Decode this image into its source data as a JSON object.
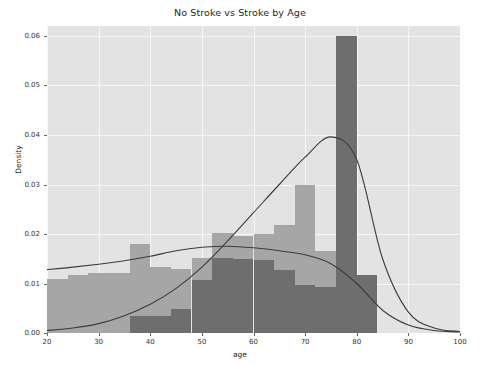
{
  "chart_data": {
    "type": "bar",
    "title": "No Stroke vs Stroke by Age",
    "xlabel": "age",
    "ylabel": "Density",
    "xlim": [
      20,
      100
    ],
    "ylim": [
      0.0,
      0.062
    ],
    "grid": true,
    "legend": "none",
    "xticks": [
      "20",
      "30",
      "40",
      "50",
      "60",
      "70",
      "80",
      "90",
      "100"
    ],
    "xtick_values": [
      20,
      30,
      40,
      50,
      60,
      70,
      80,
      90,
      100
    ],
    "yticks": [
      "0.00",
      "0.01",
      "0.02",
      "0.03",
      "0.04",
      "0.05",
      "0.06"
    ],
    "ytick_values": [
      0.0,
      0.01,
      0.02,
      0.03,
      0.04,
      0.05,
      0.06
    ],
    "bin_width": 4,
    "series": [
      {
        "name": "No Stroke",
        "kind": "histogram",
        "color": "#a6a6a6",
        "bin_starts": [
          20,
          24,
          28,
          32,
          36,
          40,
          44,
          48,
          52,
          56,
          60,
          64,
          68,
          72,
          76,
          80
        ],
        "values": [
          0.011,
          0.0118,
          0.0121,
          0.0122,
          0.018,
          0.0133,
          0.013,
          0.0152,
          0.0203,
          0.0197,
          0.02,
          0.0218,
          0.03,
          0.0165,
          0.0105,
          0.0
        ]
      },
      {
        "name": "Stroke",
        "kind": "histogram",
        "color": "#6e6e6e",
        "bin_starts": [
          20,
          24,
          28,
          32,
          36,
          40,
          44,
          48,
          52,
          56,
          60,
          64,
          68,
          72,
          76,
          80
        ],
        "values": [
          0.0,
          0.0,
          0.0,
          0.0,
          0.0034,
          0.0034,
          0.0048,
          0.0108,
          0.0152,
          0.015,
          0.0148,
          0.0128,
          0.0098,
          0.0093,
          0.06,
          0.0117
        ]
      },
      {
        "name": "No Stroke KDE",
        "kind": "kde",
        "color": "#3b3b3b",
        "peak_x": 55,
        "peak_y": 0.0175,
        "x": [
          20,
          25,
          30,
          35,
          40,
          45,
          50,
          55,
          60,
          65,
          70,
          75,
          80,
          85,
          90,
          95,
          100
        ],
        "y": [
          0.0128,
          0.0133,
          0.0139,
          0.0146,
          0.0155,
          0.0166,
          0.0173,
          0.0175,
          0.0172,
          0.0166,
          0.0158,
          0.014,
          0.01,
          0.0046,
          0.0016,
          0.0005,
          0.0002
        ]
      },
      {
        "name": "Stroke KDE",
        "kind": "kde",
        "color": "#3b3b3b",
        "peak_x": 77,
        "peak_y": 0.04,
        "x": [
          20,
          25,
          30,
          35,
          40,
          45,
          50,
          55,
          60,
          65,
          70,
          75,
          80,
          85,
          90,
          95,
          100
        ],
        "y": [
          0.0005,
          0.001,
          0.0019,
          0.0035,
          0.0058,
          0.009,
          0.0133,
          0.0186,
          0.0243,
          0.03,
          0.0355,
          0.0396,
          0.035,
          0.015,
          0.0042,
          0.001,
          0.0003
        ]
      }
    ]
  }
}
